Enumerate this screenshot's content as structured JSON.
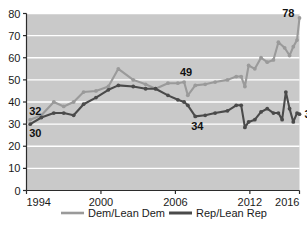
{
  "chart_data": {
    "type": "line",
    "title": "",
    "subtitle": "",
    "xlabel": "",
    "ylabel": "",
    "xlim": [
      1994,
      2016
    ],
    "ylim": [
      0,
      80
    ],
    "ytick_values": [
      0,
      10,
      20,
      30,
      40,
      50,
      60,
      70,
      80
    ],
    "ytick_labels": [
      "0",
      "10",
      "20",
      "30",
      "40",
      "50",
      "60",
      "70",
      "80"
    ],
    "xtick_values": [
      1994,
      2000,
      2006,
      2012,
      2016
    ],
    "xtick_labels": [
      "1994",
      "2000",
      "2006",
      "2012",
      "2016"
    ],
    "grid": true,
    "legend_position": "bottom",
    "series": [
      {
        "name": "Dem/Lean Dem",
        "color": "#9a9a9a",
        "points": [
          [
            1994.3,
            32
          ],
          [
            1995.2,
            34
          ],
          [
            1996.2,
            40
          ],
          [
            1997.0,
            38
          ],
          [
            1997.8,
            40
          ],
          [
            1998.6,
            44.5
          ],
          [
            1999.6,
            45
          ],
          [
            2000.6,
            47
          ],
          [
            2001.4,
            55
          ],
          [
            2002.6,
            50
          ],
          [
            2003.6,
            48
          ],
          [
            2004.4,
            46
          ],
          [
            2005.4,
            48.5
          ],
          [
            2006.2,
            48.5
          ],
          [
            2006.7,
            49
          ],
          [
            2007.0,
            43
          ],
          [
            2007.6,
            47.5
          ],
          [
            2008.4,
            48
          ],
          [
            2009.2,
            49
          ],
          [
            2010.2,
            50
          ],
          [
            2010.9,
            51.5
          ],
          [
            2011.3,
            51.5
          ],
          [
            2011.6,
            47
          ],
          [
            2011.9,
            56.5
          ],
          [
            2012.4,
            55
          ],
          [
            2012.9,
            60
          ],
          [
            2013.4,
            58
          ],
          [
            2013.9,
            59
          ],
          [
            2014.3,
            67
          ],
          [
            2014.8,
            64.5
          ],
          [
            2015.2,
            61
          ],
          [
            2015.5,
            65
          ],
          [
            2015.8,
            68
          ],
          [
            2016.0,
            78
          ]
        ],
        "start_label": "32",
        "mid_label": "49",
        "end_label": "78"
      },
      {
        "name": "Rep/Lean Rep",
        "color": "#4a4a4a",
        "points": [
          [
            1994.3,
            30
          ],
          [
            1995.2,
            33
          ],
          [
            1996.2,
            35
          ],
          [
            1997.0,
            35
          ],
          [
            1997.8,
            34
          ],
          [
            1998.6,
            39
          ],
          [
            1999.6,
            42
          ],
          [
            2000.6,
            45.5
          ],
          [
            2001.4,
            47.5
          ],
          [
            2002.6,
            47
          ],
          [
            2003.6,
            46
          ],
          [
            2004.4,
            46
          ],
          [
            2005.4,
            43
          ],
          [
            2006.2,
            41
          ],
          [
            2006.7,
            40
          ],
          [
            2007.0,
            38.5
          ],
          [
            2007.6,
            33.5
          ],
          [
            2008.4,
            34
          ],
          [
            2009.2,
            35
          ],
          [
            2010.2,
            36
          ],
          [
            2010.9,
            38.5
          ],
          [
            2011.3,
            38.5
          ],
          [
            2011.6,
            28.5
          ],
          [
            2011.9,
            31
          ],
          [
            2012.4,
            32
          ],
          [
            2012.9,
            35.5
          ],
          [
            2013.4,
            37
          ],
          [
            2013.9,
            35
          ],
          [
            2014.3,
            35
          ],
          [
            2014.6,
            32
          ],
          [
            2014.9,
            44.5
          ],
          [
            2015.2,
            37
          ],
          [
            2015.5,
            31
          ],
          [
            2015.8,
            35
          ],
          [
            2016.0,
            34.5
          ]
        ],
        "start_label": "30",
        "mid_label": "34",
        "end_label": "35"
      }
    ],
    "annotations": [
      {
        "text": "32",
        "series": "Dem/Lean Dem",
        "x": 1994.3,
        "y": 32
      },
      {
        "text": "30",
        "series": "Rep/Lean Rep",
        "x": 1994.3,
        "y": 30
      },
      {
        "text": "49",
        "series": "Dem/Lean Dem",
        "x": 2006.7,
        "y": 49
      },
      {
        "text": "34",
        "series": "Rep/Lean Rep",
        "x": 2007.6,
        "y": 33.5
      },
      {
        "text": "78",
        "series": "Dem/Lean Dem",
        "x": 2016.0,
        "y": 78
      },
      {
        "text": "35",
        "series": "Rep/Lean Rep",
        "x": 2016.0,
        "y": 34.5
      }
    ]
  },
  "legend": {
    "items": [
      {
        "label": "Dem/Lean Dem",
        "color": "#9a9a9a"
      },
      {
        "label": "Rep/Lean Rep",
        "color": "#4a4a4a"
      }
    ]
  },
  "colors": {
    "plot_background": "#c9c9c9",
    "gridline": "#ffffff",
    "axis": "#2b2b2b",
    "text": "#1a1a1a",
    "dem": "#9a9a9a",
    "rep": "#4a4a4a"
  }
}
